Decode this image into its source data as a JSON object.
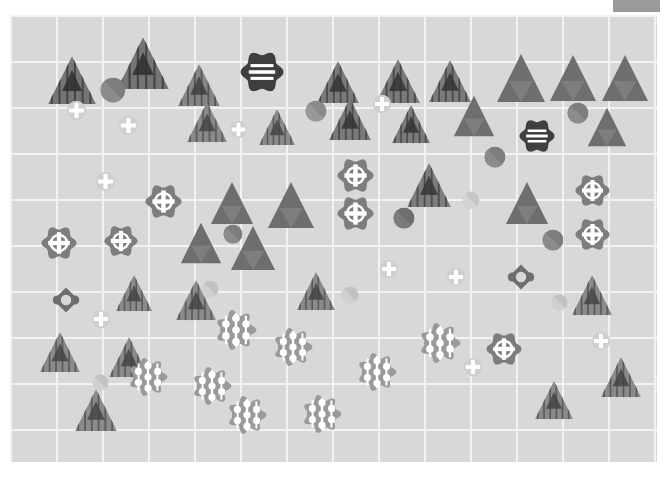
{
  "canvas": {
    "width": 667,
    "height": 477,
    "background": "#ffffff",
    "plot": {
      "x": 10,
      "y": 15,
      "width": 647,
      "height": 447,
      "background": "#d8d8d8",
      "gridline_color": "#f2f2f2",
      "gridline_spacing": 46
    },
    "corner_bar": {
      "label": "corner-bar",
      "x": 613,
      "y": 0,
      "width": 47,
      "height": 12,
      "color": "#9a9a9a"
    }
  },
  "palette": {
    "dark_gray": "#4a4a4a",
    "mid_gray": "#7d7d7d",
    "medium_gray": "#888888",
    "light_gray": "#b9b9b9",
    "pale_gray": "#cccccc",
    "very_pale": "#d0d0d0",
    "plot_bg": "#d8d8d8",
    "grid": "#f2f2f2",
    "white": "#ffffff"
  },
  "legend": {
    "shape_kinds": [
      {
        "id": "striped-triangle",
        "name": "striped triangle",
        "color": "#7d7d7d",
        "description": "triangle filled with vertical stripes and a small dark inner triangle"
      },
      {
        "id": "solid-triangle",
        "name": "solid triangle",
        "color": "#6f6f6f",
        "description": "solid triangle with faint inverted inner triangle"
      },
      {
        "id": "half-circle",
        "name": "two-tone circle",
        "color": "#7d7d7d",
        "description": "circle split diagonally into two gray tones"
      },
      {
        "id": "pale-cross-circle",
        "name": "pale circle with cross",
        "color": "#cfcfcf",
        "description": "light circle containing a white plus sign"
      },
      {
        "id": "flower-cross",
        "name": "flower with cross",
        "color": "#7d7d7d",
        "description": "scalloped flower outline containing a white cross in a circle"
      },
      {
        "id": "flower-stripes",
        "name": "dark flower with stripes",
        "color": "#4a4a4a",
        "description": "dark scalloped flower with three white horizontal bands"
      },
      {
        "id": "flower-dots",
        "name": "flower with dots",
        "color": "#9a9a9a",
        "description": "cloud-like rosette containing five white dots"
      },
      {
        "id": "four-petal-diamond",
        "name": "four petal diamond",
        "color": "#7d7d7d",
        "description": "diamond with four round lobes and a white center"
      }
    ]
  },
  "shapes": [
    {
      "kind": "striped-triangle",
      "x": 72,
      "y": 80,
      "size": 50,
      "color": "#757575"
    },
    {
      "kind": "striped-triangle",
      "x": 143,
      "y": 63,
      "size": 54,
      "color": "#757575"
    },
    {
      "kind": "striped-triangle",
      "x": 199,
      "y": 85,
      "size": 44,
      "color": "#858585"
    },
    {
      "kind": "flower-stripes",
      "x": 262,
      "y": 72,
      "size": 44,
      "color": "#3f3f3f"
    },
    {
      "kind": "striped-triangle",
      "x": 338,
      "y": 82,
      "size": 44,
      "color": "#7a7a7a"
    },
    {
      "kind": "striped-triangle",
      "x": 398,
      "y": 81,
      "size": 46,
      "color": "#7a7a7a"
    },
    {
      "kind": "striped-triangle",
      "x": 450,
      "y": 81,
      "size": 44,
      "color": "#7a7a7a"
    },
    {
      "kind": "solid-triangle",
      "x": 521,
      "y": 78,
      "size": 50,
      "color": "#6e6e6e"
    },
    {
      "kind": "solid-triangle",
      "x": 573,
      "y": 78,
      "size": 48,
      "color": "#6e6e6e"
    },
    {
      "kind": "solid-triangle",
      "x": 625,
      "y": 78,
      "size": 48,
      "color": "#6e6e6e"
    },
    {
      "kind": "half-circle",
      "x": 113,
      "y": 90,
      "size": 26,
      "color": "#7d7d7d"
    },
    {
      "kind": "pale-cross-circle",
      "x": 76,
      "y": 110,
      "size": 21,
      "color": "#cfcfcf"
    },
    {
      "kind": "pale-cross-circle",
      "x": 128,
      "y": 125,
      "size": 21,
      "color": "#cfcfcf"
    },
    {
      "kind": "striped-triangle",
      "x": 207,
      "y": 122,
      "size": 42,
      "color": "#8a8a8a"
    },
    {
      "kind": "pale-cross-circle",
      "x": 238,
      "y": 129,
      "size": 19,
      "color": "#cfcfcf"
    },
    {
      "kind": "striped-triangle",
      "x": 277,
      "y": 127,
      "size": 38,
      "color": "#8a8a8a"
    },
    {
      "kind": "half-circle",
      "x": 316,
      "y": 111,
      "size": 22,
      "color": "#8a8a8a"
    },
    {
      "kind": "striped-triangle",
      "x": 350,
      "y": 119,
      "size": 44,
      "color": "#7a7a7a"
    },
    {
      "kind": "pale-cross-circle",
      "x": 382,
      "y": 104,
      "size": 20,
      "color": "#cfcfcf"
    },
    {
      "kind": "striped-triangle",
      "x": 411,
      "y": 124,
      "size": 40,
      "color": "#7a7a7a"
    },
    {
      "kind": "solid-triangle",
      "x": 474,
      "y": 116,
      "size": 42,
      "color": "#6e6e6e"
    },
    {
      "kind": "half-circle",
      "x": 578,
      "y": 113,
      "size": 22,
      "color": "#7d7d7d"
    },
    {
      "kind": "flower-stripes",
      "x": 537,
      "y": 136,
      "size": 36,
      "color": "#3f3f3f"
    },
    {
      "kind": "solid-triangle",
      "x": 607,
      "y": 127,
      "size": 40,
      "color": "#6e6e6e"
    },
    {
      "kind": "pale-cross-circle",
      "x": 105,
      "y": 181,
      "size": 21,
      "color": "#cfcfcf"
    },
    {
      "kind": "flower-cross",
      "x": 163,
      "y": 201,
      "size": 37,
      "color": "#7d7d7d"
    },
    {
      "kind": "flower-cross",
      "x": 355,
      "y": 175,
      "size": 37,
      "color": "#7d7d7d"
    },
    {
      "kind": "flower-cross",
      "x": 355,
      "y": 213,
      "size": 37,
      "color": "#7d7d7d"
    },
    {
      "kind": "striped-triangle",
      "x": 429,
      "y": 185,
      "size": 46,
      "color": "#7d7d7d"
    },
    {
      "kind": "half-circle",
      "x": 495,
      "y": 157,
      "size": 22,
      "color": "#7d7d7d"
    },
    {
      "kind": "half-circle",
      "x": 471,
      "y": 200,
      "size": 18,
      "color": "#c6c6c6"
    },
    {
      "kind": "solid-triangle",
      "x": 527,
      "y": 203,
      "size": 44,
      "color": "#6e6e6e"
    },
    {
      "kind": "flower-cross",
      "x": 592,
      "y": 190,
      "size": 35,
      "color": "#7d7d7d"
    },
    {
      "kind": "flower-cross",
      "x": 592,
      "y": 234,
      "size": 35,
      "color": "#7d7d7d"
    },
    {
      "kind": "half-circle",
      "x": 553,
      "y": 240,
      "size": 22,
      "color": "#7d7d7d"
    },
    {
      "kind": "solid-triangle",
      "x": 232,
      "y": 203,
      "size": 44,
      "color": "#6e6e6e"
    },
    {
      "kind": "solid-triangle",
      "x": 291,
      "y": 205,
      "size": 48,
      "color": "#6e6e6e"
    },
    {
      "kind": "half-circle",
      "x": 233,
      "y": 234,
      "size": 20,
      "color": "#7d7d7d"
    },
    {
      "kind": "half-circle",
      "x": 404,
      "y": 218,
      "size": 22,
      "color": "#6e6e6e"
    },
    {
      "kind": "flower-cross",
      "x": 59,
      "y": 243,
      "size": 36,
      "color": "#7d7d7d"
    },
    {
      "kind": "flower-cross",
      "x": 121,
      "y": 241,
      "size": 34,
      "color": "#7d7d7d"
    },
    {
      "kind": "solid-triangle",
      "x": 201,
      "y": 243,
      "size": 42,
      "color": "#6e6e6e"
    },
    {
      "kind": "solid-triangle",
      "x": 253,
      "y": 248,
      "size": 46,
      "color": "#6e6e6e"
    },
    {
      "kind": "four-petal-diamond",
      "x": 66,
      "y": 300,
      "size": 26,
      "color": "#6e6e6e"
    },
    {
      "kind": "four-petal-diamond",
      "x": 521,
      "y": 277,
      "size": 26,
      "color": "#6e6e6e"
    },
    {
      "kind": "striped-triangle",
      "x": 134,
      "y": 293,
      "size": 38,
      "color": "#8a8a8a"
    },
    {
      "kind": "striped-triangle",
      "x": 196,
      "y": 300,
      "size": 42,
      "color": "#8a8a8a"
    },
    {
      "kind": "half-circle",
      "x": 210,
      "y": 289,
      "size": 18,
      "color": "#c2c2c2"
    },
    {
      "kind": "striped-triangle",
      "x": 316,
      "y": 291,
      "size": 40,
      "color": "#8a8a8a"
    },
    {
      "kind": "pale-cross-circle",
      "x": 389,
      "y": 269,
      "size": 20,
      "color": "#cfcfcf"
    },
    {
      "kind": "half-circle",
      "x": 350,
      "y": 295,
      "size": 18,
      "color": "#c2c2c2"
    },
    {
      "kind": "pale-cross-circle",
      "x": 456,
      "y": 277,
      "size": 20,
      "color": "#cfcfcf"
    },
    {
      "kind": "half-circle",
      "x": 559,
      "y": 302,
      "size": 17,
      "color": "#c2c2c2"
    },
    {
      "kind": "striped-triangle",
      "x": 592,
      "y": 295,
      "size": 42,
      "color": "#8a8a8a"
    },
    {
      "kind": "pale-cross-circle",
      "x": 101,
      "y": 319,
      "size": 20,
      "color": "#cfcfcf"
    },
    {
      "kind": "striped-triangle",
      "x": 60,
      "y": 352,
      "size": 42,
      "color": "#8a8a8a"
    },
    {
      "kind": "striped-triangle",
      "x": 129,
      "y": 357,
      "size": 42,
      "color": "#8a8a8a"
    },
    {
      "kind": "flower-dots",
      "x": 236,
      "y": 330,
      "size": 42,
      "color": "#9a9a9a"
    },
    {
      "kind": "flower-dots",
      "x": 293,
      "y": 347,
      "size": 40,
      "color": "#9a9a9a"
    },
    {
      "kind": "flower-dots",
      "x": 212,
      "y": 386,
      "size": 40,
      "color": "#9a9a9a"
    },
    {
      "kind": "flower-dots",
      "x": 440,
      "y": 343,
      "size": 42,
      "color": "#9a9a9a"
    },
    {
      "kind": "flower-dots",
      "x": 377,
      "y": 372,
      "size": 40,
      "color": "#9a9a9a"
    },
    {
      "kind": "flower-dots",
      "x": 322,
      "y": 414,
      "size": 40,
      "color": "#9a9a9a"
    },
    {
      "kind": "flower-dots",
      "x": 247,
      "y": 415,
      "size": 40,
      "color": "#9a9a9a"
    },
    {
      "kind": "flower-dots",
      "x": 148,
      "y": 377,
      "size": 40,
      "color": "#9a9a9a"
    },
    {
      "kind": "flower-cross",
      "x": 504,
      "y": 349,
      "size": 36,
      "color": "#7d7d7d"
    },
    {
      "kind": "pale-cross-circle",
      "x": 473,
      "y": 367,
      "size": 20,
      "color": "#cfcfcf"
    },
    {
      "kind": "pale-cross-circle",
      "x": 601,
      "y": 341,
      "size": 20,
      "color": "#cfcfcf"
    },
    {
      "kind": "striped-triangle",
      "x": 554,
      "y": 400,
      "size": 40,
      "color": "#8a8a8a"
    },
    {
      "kind": "striped-triangle",
      "x": 621,
      "y": 377,
      "size": 42,
      "color": "#8a8a8a"
    },
    {
      "kind": "striped-triangle",
      "x": 96,
      "y": 410,
      "size": 44,
      "color": "#8a8a8a"
    },
    {
      "kind": "half-circle",
      "x": 100,
      "y": 382,
      "size": 17,
      "color": "#c2c2c2"
    }
  ]
}
